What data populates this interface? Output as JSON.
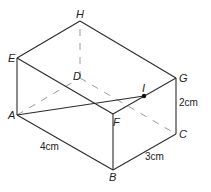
{
  "diagram": {
    "type": "cuboid",
    "vertices": {
      "A": {
        "label": "A",
        "x": 17,
        "y": 115
      },
      "B": {
        "label": "B",
        "x": 113,
        "y": 170
      },
      "C": {
        "label": "C",
        "x": 176,
        "y": 134
      },
      "D": {
        "label": "D",
        "x": 80,
        "y": 78
      },
      "E": {
        "label": "E",
        "x": 17,
        "y": 58
      },
      "F": {
        "label": "F",
        "x": 113,
        "y": 114
      },
      "G": {
        "label": "G",
        "x": 176,
        "y": 78
      },
      "H": {
        "label": "H",
        "x": 80,
        "y": 21
      },
      "I": {
        "label": "I",
        "x": 144,
        "y": 96
      }
    },
    "dimensions": {
      "AB": "4cm",
      "BC": "3cm",
      "CG": "2cm"
    },
    "visible_edges": [
      "AB",
      "BC",
      "CG",
      "GH",
      "HE",
      "EA",
      "EF",
      "FG",
      "FB",
      "AI"
    ],
    "hidden_edges": [
      "AD",
      "DC",
      "DH"
    ],
    "point": {
      "name": "I",
      "on_edge": "FG"
    },
    "colors": {
      "edge": "#2b2b2b",
      "hidden": "#9a9a9a",
      "background": "#ffffff"
    }
  }
}
